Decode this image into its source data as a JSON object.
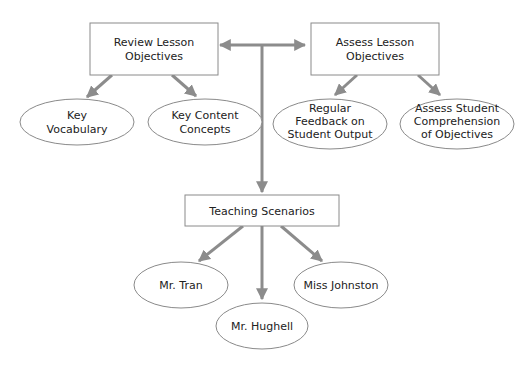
{
  "diagram": {
    "colors": {
      "line": "#8c8c8c",
      "box_stroke": "#8a8a8a",
      "text": "#222222"
    },
    "boxes": {
      "review": {
        "lines": [
          "Review Lesson",
          "Objectives"
        ]
      },
      "assess": {
        "lines": [
          "Assess Lesson",
          "Objectives"
        ]
      },
      "teaching": {
        "lines": [
          "Teaching Scenarios"
        ]
      }
    },
    "ellipses": {
      "key_vocab": {
        "lines": [
          "Key",
          "Vocabulary"
        ]
      },
      "key_content": {
        "lines": [
          "Key Content",
          "Concepts"
        ]
      },
      "regular_feedback": {
        "lines": [
          "Regular",
          "Feedback on",
          "Student Output"
        ]
      },
      "assess_student": {
        "lines": [
          "Assess Student",
          "Comprehension",
          "of Objectives"
        ]
      },
      "tran": {
        "lines": [
          "Mr. Tran"
        ]
      },
      "hughell": {
        "lines": [
          "Mr. Hughell"
        ]
      },
      "johnston": {
        "lines": [
          "Miss Johnston"
        ]
      }
    }
  }
}
